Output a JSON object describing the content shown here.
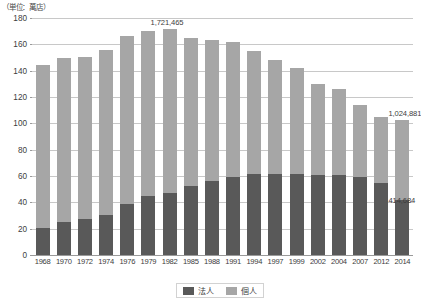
{
  "unit_caption": "（単位：萬店）",
  "chart_data": {
    "type": "bar",
    "title": "",
    "subtitle": "",
    "xlabel": "",
    "ylabel": "",
    "unit_note": "（単位：萬店）",
    "stacked": true,
    "grid": true,
    "legend_position": "bottom",
    "ylim": [
      0,
      180
    ],
    "yticks": [
      0,
      20,
      40,
      60,
      80,
      100,
      120,
      140,
      160,
      180
    ],
    "categories": [
      "1968",
      "1970",
      "1972",
      "1974",
      "1976",
      "1979",
      "1982",
      "1985",
      "1988",
      "1991",
      "1994",
      "1997",
      "1999",
      "2002",
      "2004",
      "2007",
      "2012",
      "2014"
    ],
    "series": [
      {
        "name": "法人",
        "color": "#595959",
        "values": [
          20.5,
          25.0,
          27.5,
          30.5,
          39.0,
          44.5,
          47.0,
          52.5,
          56.0,
          59.5,
          61.5,
          61.5,
          61.5,
          61.0,
          60.5,
          59.5,
          55.0,
          41.5
        ]
      },
      {
        "name": "個人",
        "color": "#a6a6a6",
        "values": [
          123.5,
          125.0,
          123.0,
          125.5,
          127.0,
          125.5,
          125.0,
          112.5,
          107.0,
          102.0,
          93.5,
          86.5,
          80.5,
          69.0,
          65.5,
          54.5,
          50.0,
          61.0
        ]
      }
    ],
    "totals": [
      144.0,
      150.0,
      150.5,
      156.0,
      166.0,
      170.0,
      172.0,
      165.0,
      163.0,
      161.5,
      155.0,
      148.0,
      142.0,
      130.0,
      126.0,
      114.0,
      105.0,
      102.5
    ],
    "annotations": [
      {
        "id": "peak-total",
        "text": "1,721,465",
        "category": "1982",
        "value": 172.0,
        "placement": "above-bar"
      },
      {
        "id": "last-total",
        "text": "1,024,881",
        "category": "2014",
        "value": 102.5,
        "placement": "above-bar"
      },
      {
        "id": "last-corporate",
        "text": "414,684",
        "category": "2014",
        "value": 41.5,
        "placement": "segment-top"
      }
    ]
  },
  "legend": {
    "items": [
      {
        "label": "法人",
        "color": "#595959"
      },
      {
        "label": "個人",
        "color": "#a6a6a6"
      }
    ]
  }
}
